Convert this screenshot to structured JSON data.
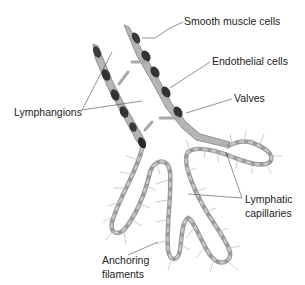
{
  "labels": {
    "smooth_muscle": "Smooth muscle cells",
    "endothelial": "Endothelial cells",
    "valves": "Valves",
    "lymphangions": "Lymphangions",
    "lymphatic_capillaries_1": "Lymphatic",
    "lymphatic_capillaries_2": "capillaries",
    "anchoring_1": "Anchoring",
    "anchoring_2": "filaments"
  },
  "colors": {
    "vessel_fill": "#b8b8b8",
    "muscle_cell": "#3a3a3a",
    "nucleus": "#555555",
    "filament": "#bbbbbb",
    "leader_line": "#333333"
  }
}
